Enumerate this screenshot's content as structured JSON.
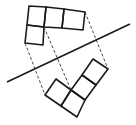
{
  "diagram": {
    "stroke_color": "#1a1a1a",
    "dash_color": "#333333",
    "background": "#ffffff",
    "mirror_line": {
      "x1": 7,
      "y1": 82,
      "x2": 130,
      "y2": 24
    },
    "original_shape": {
      "squares": [
        [
          [
            29,
            6
          ],
          [
            46,
            7
          ],
          [
            44,
            27
          ],
          [
            27,
            25
          ]
        ],
        [
          [
            46,
            7
          ],
          [
            64,
            9
          ],
          [
            62,
            28
          ],
          [
            44,
            27
          ]
        ],
        [
          [
            64,
            9
          ],
          [
            85,
            12
          ],
          [
            83,
            30
          ],
          [
            62,
            28
          ]
        ],
        [
          [
            27,
            25
          ],
          [
            44,
            27
          ],
          [
            43,
            45
          ],
          [
            25,
            43
          ]
        ]
      ]
    },
    "reflected_shape": {
      "squares": [
        [
          [
            93,
            59
          ],
          [
            108,
            69
          ],
          [
            96,
            85
          ],
          [
            82,
            75
          ]
        ],
        [
          [
            82,
            75
          ],
          [
            96,
            85
          ],
          [
            85,
            100
          ],
          [
            71,
            90
          ]
        ],
        [
          [
            71,
            90
          ],
          [
            85,
            100
          ],
          [
            77,
            117
          ],
          [
            61,
            106
          ]
        ],
        [
          [
            56,
            79
          ],
          [
            71,
            90
          ],
          [
            61,
            106
          ],
          [
            45,
            95
          ]
        ]
      ]
    },
    "projection_lines": [
      {
        "x1": 85,
        "y1": 12,
        "x2": 108,
        "y2": 69
      },
      {
        "x1": 44,
        "y1": 27,
        "x2": 71,
        "y2": 90
      },
      {
        "x1": 25,
        "y1": 43,
        "x2": 45,
        "y2": 95
      }
    ]
  }
}
